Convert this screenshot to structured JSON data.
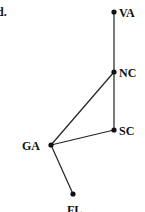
{
  "part_label": "d.",
  "graph": {
    "nodes": [
      {
        "id": "VA",
        "label": "VA",
        "x": 114,
        "y": 12,
        "lx": 119,
        "ly": 17
      },
      {
        "id": "NC",
        "label": "NC",
        "x": 114,
        "y": 72,
        "lx": 119,
        "ly": 77
      },
      {
        "id": "SC",
        "label": "SC",
        "x": 114,
        "y": 130,
        "lx": 119,
        "ly": 135
      },
      {
        "id": "GA",
        "label": "GA",
        "x": 51,
        "y": 145,
        "lx": 22,
        "ly": 150
      },
      {
        "id": "FL",
        "label": "FL",
        "x": 73,
        "y": 194,
        "lx": 67,
        "ly": 214
      }
    ],
    "edges": [
      [
        "VA",
        "NC"
      ],
      [
        "NC",
        "SC"
      ],
      [
        "NC",
        "GA"
      ],
      [
        "SC",
        "GA"
      ],
      [
        "GA",
        "FL"
      ]
    ],
    "colors": {
      "line": "#222222",
      "node": "#111111"
    }
  }
}
